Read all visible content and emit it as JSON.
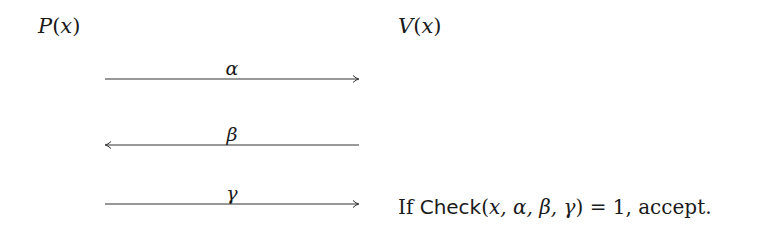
{
  "prover": {
    "name": "P",
    "arg": "x"
  },
  "verifier": {
    "name": "V",
    "arg": "x"
  },
  "messages": [
    {
      "label": "α",
      "direction": "right"
    },
    {
      "label": "β",
      "direction": "left"
    },
    {
      "label": "γ",
      "direction": "right"
    }
  ],
  "decision": {
    "prefix": "If ",
    "func": "Check",
    "open": "(",
    "args": "x, α, β, γ",
    "close": ") = 1, accept."
  },
  "colors": {
    "line": "#333333",
    "text": "#1a1a1a"
  }
}
